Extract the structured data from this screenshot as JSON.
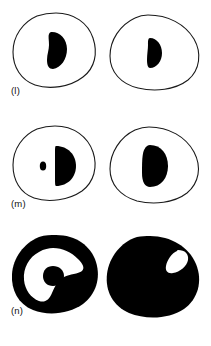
{
  "figure": {
    "background_color": "#ffffff",
    "ink_color": "#000000",
    "outline_color": "#1a1a1a",
    "panel_count": 3,
    "columns_per_panel": 2,
    "rows": [
      {
        "id": "l",
        "label": "(l)",
        "description": "Two thin-outlined ovoid cross-sections, each containing a single solid black inclusion near the centre.",
        "cells": [
          {
            "position": "left",
            "outline_style": "thin-outline",
            "fill": "white",
            "inclusions": [
              {
                "name": "kidney-blob",
                "fill": "#000000",
                "relative_size": "large",
                "placement": "centre"
              }
            ]
          },
          {
            "position": "right",
            "outline_style": "thin-outline",
            "fill": "white",
            "inclusions": [
              {
                "name": "half-disc-blob",
                "fill": "#000000",
                "relative_size": "small",
                "placement": "centre"
              }
            ]
          }
        ]
      },
      {
        "id": "m",
        "label": "(m)",
        "description": "Two thin-outlined ovoid cross-sections; the left one has a small dot plus a half-disc, the right one a single rounded solid inclusion.",
        "cells": [
          {
            "position": "left",
            "outline_style": "thin-outline",
            "fill": "white",
            "inclusions": [
              {
                "name": "small-dot",
                "fill": "#000000",
                "relative_size": "tiny",
                "placement": "centre-left"
              },
              {
                "name": "half-disc-blob",
                "fill": "#000000",
                "relative_size": "medium",
                "placement": "centre"
              }
            ]
          },
          {
            "position": "right",
            "outline_style": "thin-outline",
            "fill": "white",
            "inclusions": [
              {
                "name": "rounded-blob",
                "fill": "#000000",
                "relative_size": "medium",
                "placement": "centre"
              }
            ]
          }
        ]
      },
      {
        "id": "n",
        "label": "(n)",
        "description": "Two solid black cross-sections; the left is a thick ring enclosing a white interior with a small black blob, the right is a filled mass with a small white sliver at upper right.",
        "cells": [
          {
            "position": "left",
            "outline_style": "solid-filled",
            "fill": "black",
            "inclusions": [
              {
                "name": "white-interior-cavity",
                "fill": "#ffffff",
                "relative_size": "large",
                "placement": "centre"
              },
              {
                "name": "inner-black-blob",
                "fill": "#000000",
                "relative_size": "small",
                "placement": "centre"
              }
            ]
          },
          {
            "position": "right",
            "outline_style": "solid-filled",
            "fill": "black",
            "inclusions": [
              {
                "name": "white-sliver",
                "fill": "#ffffff",
                "relative_size": "tiny",
                "placement": "upper-right"
              }
            ]
          }
        ]
      }
    ]
  }
}
